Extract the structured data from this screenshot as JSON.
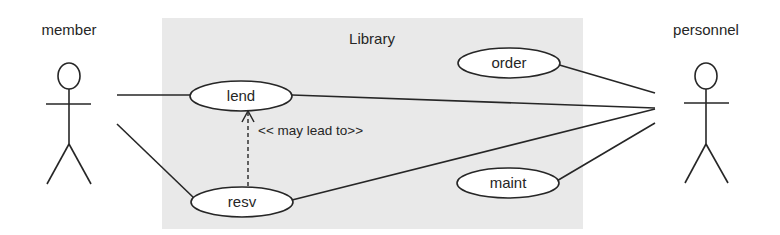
{
  "diagram": {
    "type": "uml-use-case",
    "colors": {
      "system_fill": "#e9e9e9",
      "stroke": "#262626",
      "usecase_fill": "#ffffff",
      "background": "#ffffff"
    },
    "system": {
      "label": "Library"
    },
    "actors": [
      {
        "id": "member",
        "label": "member"
      },
      {
        "id": "personnel",
        "label": "personnel"
      }
    ],
    "use_cases": [
      {
        "id": "lend",
        "label": "lend"
      },
      {
        "id": "resv",
        "label": "resv"
      },
      {
        "id": "order",
        "label": "order"
      },
      {
        "id": "maint",
        "label": "maint"
      }
    ],
    "associations": [
      {
        "from": "member",
        "to": "lend"
      },
      {
        "from": "member",
        "to": "resv"
      },
      {
        "from": "personnel",
        "to": "lend"
      },
      {
        "from": "personnel",
        "to": "resv"
      },
      {
        "from": "personnel",
        "to": "order"
      },
      {
        "from": "personnel",
        "to": "maint"
      }
    ],
    "dependencies": [
      {
        "from": "resv",
        "to": "lend",
        "style": "dashed-arrow",
        "label": "<< may lead to>>"
      }
    ]
  }
}
